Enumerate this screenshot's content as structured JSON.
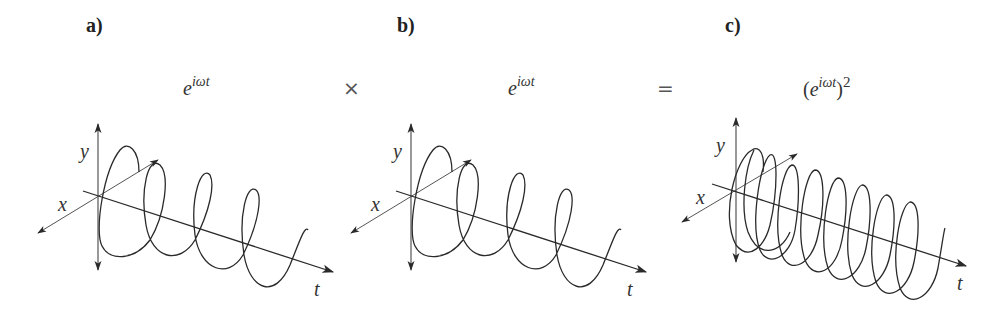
{
  "panels": [
    {
      "label": "a)",
      "formula": {
        "base": "e",
        "exponent": "iωt",
        "power": ""
      },
      "axes": {
        "x": "x",
        "y": "y",
        "t": "t"
      },
      "loops": 4
    },
    {
      "label": "b)",
      "formula": {
        "base": "e",
        "exponent": "iωt",
        "power": ""
      },
      "axes": {
        "x": "x",
        "y": "y",
        "t": "t"
      },
      "loops": 4
    },
    {
      "label": "c)",
      "formula": {
        "open": "(",
        "base": "e",
        "exponent": "iωt",
        "close": ")",
        "power": "2"
      },
      "axes": {
        "x": "x",
        "y": "y",
        "t": "t"
      },
      "loops": 9
    }
  ],
  "operators": {
    "multiply": "×",
    "equals": "="
  },
  "colors": {
    "stroke": "#2a2a2a",
    "axis": "#444444",
    "background": "#ffffff"
  }
}
